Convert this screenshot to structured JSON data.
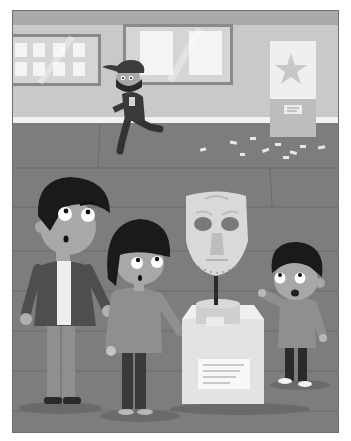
{
  "scene": {
    "title": "Museum theft illustration",
    "style": "grayscale cartoon",
    "setting": "museum gallery",
    "elements": {
      "wall_frames": [
        {
          "name": "left-display-frame",
          "panes": 8
        },
        {
          "name": "center-display-frame",
          "panes": 2
        }
      ],
      "poster": {
        "name": "star-poster",
        "icon": "star-icon"
      },
      "thief": {
        "name": "masked-thief",
        "action": "running away",
        "accessories": [
          "cap",
          "face-mask"
        ]
      },
      "exhibit": {
        "name": "mask-on-pedestal",
        "object": "carved mask",
        "pedestal_label": "placard"
      },
      "people": [
        {
          "name": "father",
          "expression": "surprised"
        },
        {
          "name": "girl",
          "expression": "surprised"
        },
        {
          "name": "boy",
          "expression": "surprised",
          "action": "pointing"
        }
      ],
      "floor_debris": "scattered papers"
    },
    "colors": {
      "wall": "#c9c9c9",
      "wall_top": "#a9a9a9",
      "baseboard": "#f2f2f2",
      "floor": "#7d7d7d",
      "floor_line": "#6a6a6a",
      "hair": "#1a1a1a",
      "skin": "#a8a8a8",
      "pedestal": "#e3e3e3",
      "mask": "#d9d9d9"
    }
  }
}
